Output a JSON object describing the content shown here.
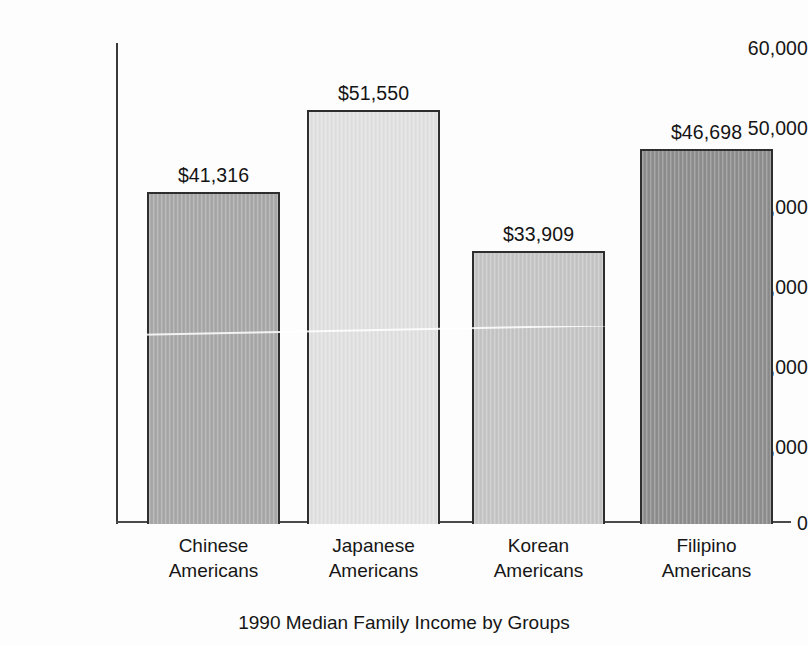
{
  "chart_data": {
    "type": "bar",
    "title": "",
    "caption": "1990 Median Family Income by Groups",
    "xlabel": "",
    "ylabel": "",
    "ylim": [
      0,
      60000
    ],
    "grid": false,
    "legend": "none",
    "ytick_labels": [
      "60,000",
      "50,000",
      "40,000",
      "30,000",
      "20,000",
      "10,000",
      "0"
    ],
    "ytick_values": [
      60000,
      50000,
      40000,
      30000,
      20000,
      10000,
      0
    ],
    "categories": [
      "Chinese Americans",
      "Japanese Americans",
      "Korean Americans",
      "Filipino Americans"
    ],
    "category_lines": [
      [
        "Chinese",
        "Americans"
      ],
      [
        "Japanese",
        "Americans"
      ],
      [
        "Korean",
        "Americans"
      ],
      [
        "Filipino",
        "Americans"
      ]
    ],
    "values": [
      41316,
      51550,
      33909,
      46698
    ],
    "data_labels": [
      "$41,316",
      "$51,550",
      "$33,909",
      "$46,698"
    ],
    "bar_colors": [
      "#a8a8a8",
      "#e2e2e2",
      "#c6c6c6",
      "#8e8e8e"
    ],
    "bar_edge_color": "#2e2e2e",
    "axis_color": "#3a3a3a",
    "background_color": "#fdfdfd"
  }
}
